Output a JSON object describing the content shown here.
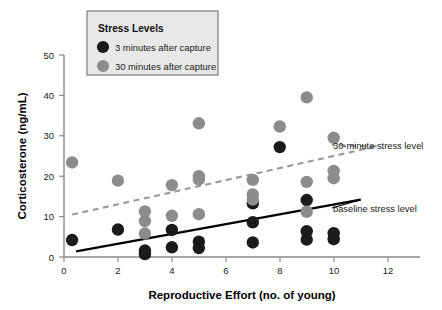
{
  "chart_data": {
    "type": "scatter",
    "title": "",
    "xlabel": "Reproductive Effort (no. of young)",
    "ylabel": "Corticosterone (ng/mL)",
    "xlim": [
      0,
      13.2
    ],
    "ylim": [
      0,
      52
    ],
    "xticks": [
      0,
      2,
      4,
      6,
      8,
      10,
      12
    ],
    "yticks": [
      0,
      10,
      20,
      30,
      40,
      50
    ],
    "grid": false,
    "legend": {
      "position": "top-left-inside",
      "title": "Stress Levels",
      "entries": [
        {
          "label": "3 minutes after capture",
          "color": "#1a1a1a",
          "marker": "circle"
        },
        {
          "label": "30 minutes after capture",
          "color": "#8c8c8c",
          "marker": "circle"
        }
      ]
    },
    "series": [
      {
        "name": "3 minutes after capture",
        "color": "#1a1a1a",
        "points": [
          [
            0.3,
            4.2
          ],
          [
            2.0,
            6.8
          ],
          [
            3.0,
            1.6
          ],
          [
            3.0,
            0.7
          ],
          [
            4.0,
            6.7
          ],
          [
            4.0,
            2.4
          ],
          [
            5.0,
            3.8
          ],
          [
            5.0,
            2.2
          ],
          [
            7.0,
            8.6
          ],
          [
            7.0,
            3.6
          ],
          [
            7.0,
            13.3
          ],
          [
            8.0,
            27.2
          ],
          [
            9.0,
            14.1
          ],
          [
            9.0,
            6.4
          ],
          [
            9.0,
            4.3
          ],
          [
            10.0,
            5.9
          ],
          [
            10.0,
            4.4
          ]
        ]
      },
      {
        "name": "30 minutes after capture",
        "color": "#8c8c8c",
        "points": [
          [
            0.3,
            23.4
          ],
          [
            2.0,
            18.9
          ],
          [
            3.0,
            11.3
          ],
          [
            3.0,
            8.9
          ],
          [
            3.0,
            5.8
          ],
          [
            4.0,
            17.8
          ],
          [
            4.0,
            10.2
          ],
          [
            5.0,
            33.1
          ],
          [
            5.0,
            20.0
          ],
          [
            5.0,
            19.2
          ],
          [
            5.0,
            10.6
          ],
          [
            7.0,
            19.1
          ],
          [
            7.0,
            15.5
          ],
          [
            7.0,
            14.2
          ],
          [
            8.0,
            32.3
          ],
          [
            9.0,
            39.5
          ],
          [
            9.0,
            18.6
          ],
          [
            9.0,
            11.2
          ],
          [
            10.0,
            29.5
          ],
          [
            10.0,
            21.3
          ],
          [
            10.0,
            19.5
          ]
        ]
      }
    ],
    "trendlines": [
      {
        "name": "30-minute stress level",
        "style": "dashed",
        "color": "#9a9a9a",
        "x0": 0.3,
        "y0": 10.5,
        "x1": 11.6,
        "y1": 27.4
      },
      {
        "name": "baseline stress level",
        "style": "solid",
        "color": "#000000",
        "x0": 0.45,
        "y0": 1.4,
        "x1": 11.0,
        "y1": 14.2
      }
    ],
    "annotations": [
      {
        "name": "30-minute stress level",
        "text": "30-minute stress level",
        "x_px": 333,
        "y_px": 146
      },
      {
        "name": "baseline stress level",
        "text": "baseline stress level",
        "x_px": 333,
        "y_px": 209
      }
    ]
  }
}
